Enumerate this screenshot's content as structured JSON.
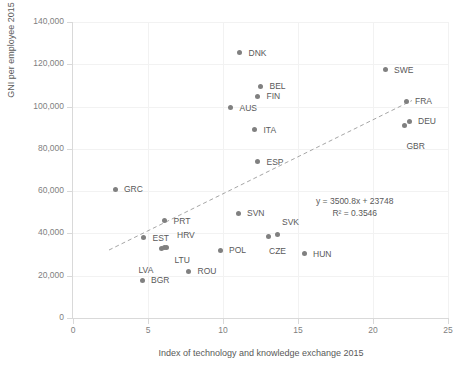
{
  "chart_data": {
    "type": "scatter",
    "title": "",
    "xlabel": "Index of technology and knowledge exchange 2015",
    "ylabel": "GNI per employee 2015",
    "xlim": [
      0,
      25
    ],
    "ylim": [
      0,
      140000
    ],
    "xticks": [
      "0",
      "5",
      "10",
      "15",
      "20",
      "25"
    ],
    "xtick_values": [
      0,
      5,
      10,
      15,
      20,
      25
    ],
    "yticks": [
      "0",
      "20,000",
      "40,000",
      "60,000",
      "80,000",
      "100,000",
      "120,000",
      "140,000"
    ],
    "ytick_values": [
      0,
      20000,
      40000,
      60000,
      80000,
      100000,
      120000,
      140000
    ],
    "grid": true,
    "legend": "none",
    "marker_color": "#808080",
    "trendline": {
      "equation": "y = 3500.8x + 23748",
      "r_squared": "R² = 0.3546",
      "slope": 3500.8,
      "intercept": 23748,
      "r2_value": 0.3546,
      "style": "dashed",
      "color": "#a6a6a6",
      "x_start": 2.4,
      "x_end": 22.6
    },
    "points": [
      {
        "label": "DNK",
        "x": 11.1,
        "y": 125500,
        "label_dx": 9,
        "label_dy": -4
      },
      {
        "label": "SWE",
        "x": 20.8,
        "y": 117500,
        "label_dx": 9,
        "label_dy": -4
      },
      {
        "label": "BEL",
        "x": 12.5,
        "y": 109500,
        "label_dx": 9,
        "label_dy": -4
      },
      {
        "label": "FIN",
        "x": 12.3,
        "y": 105000,
        "label_dx": 9,
        "label_dy": -4
      },
      {
        "label": "FRA",
        "x": 22.2,
        "y": 102500,
        "label_dx": 9,
        "label_dy": -4
      },
      {
        "label": "AUS",
        "x": 10.5,
        "y": 99500,
        "label_dx": 9,
        "label_dy": -4
      },
      {
        "label": "DEU",
        "x": 22.4,
        "y": 93000,
        "label_dx": 9,
        "label_dy": -4
      },
      {
        "label": "GBR",
        "x": 22.1,
        "y": 91000,
        "label_dx": 2,
        "label_dy": 16
      },
      {
        "label": "ITA",
        "x": 12.1,
        "y": 89000,
        "label_dx": 9,
        "label_dy": -4
      },
      {
        "label": "ESP",
        "x": 12.3,
        "y": 74000,
        "label_dx": 9,
        "label_dy": -4
      },
      {
        "label": "GRC",
        "x": 2.8,
        "y": 61000,
        "label_dx": 9,
        "label_dy": -4
      },
      {
        "label": "SVN",
        "x": 11.0,
        "y": 49500,
        "label_dx": 9,
        "label_dy": -4
      },
      {
        "label": "PRT",
        "x": 6.1,
        "y": 46000,
        "label_dx": 9,
        "label_dy": -4
      },
      {
        "label": "SVK",
        "x": 13.6,
        "y": 39500,
        "label_dx": 5,
        "label_dy": -16
      },
      {
        "label": "CZE",
        "x": 13.0,
        "y": 38500,
        "label_dx": 1,
        "label_dy": 10
      },
      {
        "label": "EST",
        "x": 4.7,
        "y": 38000,
        "label_dx": 9,
        "label_dy": -4
      },
      {
        "label": "HRV",
        "x": 6.2,
        "y": 33500,
        "label_dx": 11,
        "label_dy": -16
      },
      {
        "label": "LTU",
        "x": 6.1,
        "y": 33200,
        "label_dx": 10,
        "label_dy": 8
      },
      {
        "label": "LVA",
        "x": 5.9,
        "y": 33000,
        "label_dx": -23,
        "label_dy": 18
      },
      {
        "label": "POL",
        "x": 9.8,
        "y": 32000,
        "label_dx": 9,
        "label_dy": -4
      },
      {
        "label": "HUN",
        "x": 15.4,
        "y": 30500,
        "label_dx": 9,
        "label_dy": -4
      },
      {
        "label": "ROU",
        "x": 7.7,
        "y": 22000,
        "label_dx": 9,
        "label_dy": -4
      },
      {
        "label": "BGR",
        "x": 4.6,
        "y": 17800,
        "label_dx": 9,
        "label_dy": -4
      }
    ]
  }
}
